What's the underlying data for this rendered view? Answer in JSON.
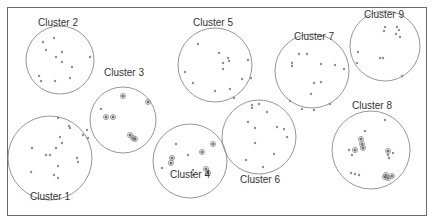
{
  "diagram": {
    "type": "cluster-map",
    "frame": {
      "x": 7,
      "y": 7,
      "w": 420,
      "h": 209
    },
    "colors": {
      "circle_stroke": "#8a8a8a",
      "point": "#8e8e8e",
      "frame": "#6a6a6a",
      "text": "#333333"
    },
    "clusters": [
      {
        "id": 1,
        "label": "Cluster 1",
        "cx": 50,
        "cy": 158,
        "r": 42,
        "label_x": 50,
        "label_y": 192,
        "points": [
          [
            58,
            118
          ],
          [
            69,
            126
          ],
          [
            70,
            128
          ],
          [
            87,
            130
          ],
          [
            83,
            135
          ],
          [
            88,
            138
          ],
          [
            60,
            137
          ],
          [
            62,
            143
          ],
          [
            32,
            148
          ],
          [
            56,
            148
          ],
          [
            46,
            155
          ],
          [
            50,
            155
          ],
          [
            77,
            158
          ],
          [
            78,
            162
          ],
          [
            31,
            172
          ],
          [
            58,
            166
          ],
          [
            54,
            175
          ],
          [
            58,
            178
          ]
        ],
        "rings": []
      },
      {
        "id": 2,
        "label": "Cluster 2",
        "cx": 60,
        "cy": 60,
        "r": 34,
        "label_x": 58,
        "label_y": 18,
        "points": [
          [
            43,
            42
          ],
          [
            54,
            38
          ],
          [
            46,
            50
          ],
          [
            62,
            52
          ],
          [
            56,
            57
          ],
          [
            62,
            62
          ],
          [
            90,
            57
          ],
          [
            72,
            67
          ],
          [
            39,
            76
          ],
          [
            41,
            81
          ],
          [
            55,
            81
          ],
          [
            70,
            78
          ]
        ],
        "rings": []
      },
      {
        "id": 3,
        "label": "Cluster 3",
        "cx": 123,
        "cy": 120,
        "r": 33,
        "label_x": 124,
        "label_y": 68,
        "points": [
          [
            101,
            109
          ]
        ],
        "rings": [
          [
            123,
            96
          ],
          [
            148,
            102
          ],
          [
            106,
            117
          ],
          [
            113,
            117
          ],
          [
            130,
            135
          ],
          [
            133,
            138
          ],
          [
            135,
            139
          ]
        ]
      },
      {
        "id": 4,
        "label": "Cluster 4",
        "cx": 190,
        "cy": 161,
        "r": 37,
        "label_x": 190,
        "label_y": 170,
        "points": [
          [
            176,
            144
          ],
          [
            188,
            155
          ],
          [
            162,
            168
          ],
          [
            193,
            170
          ],
          [
            193,
            175
          ]
        ],
        "rings": [
          [
            213,
            144
          ],
          [
            172,
            158
          ],
          [
            171,
            163
          ],
          [
            202,
            152
          ],
          [
            206,
            169
          ],
          [
            208,
            173
          ]
        ]
      },
      {
        "id": 5,
        "label": "Cluster 5",
        "cx": 215,
        "cy": 65,
        "r": 37,
        "label_x": 213,
        "label_y": 18,
        "points": [
          [
            198,
            44
          ],
          [
            219,
            53
          ],
          [
            228,
            58
          ],
          [
            229,
            61
          ],
          [
            223,
            63
          ],
          [
            223,
            69
          ],
          [
            248,
            60
          ],
          [
            185,
            72
          ],
          [
            193,
            83
          ],
          [
            242,
            79
          ],
          [
            251,
            78
          ],
          [
            230,
            89
          ],
          [
            215,
            91
          ],
          [
            234,
            98
          ]
        ],
        "rings": []
      },
      {
        "id": 6,
        "label": "Cluster 6",
        "cx": 259,
        "cy": 137,
        "r": 37,
        "label_x": 260,
        "label_y": 175,
        "points": [
          [
            252,
            105
          ],
          [
            252,
            108
          ],
          [
            259,
            104
          ],
          [
            267,
            112
          ],
          [
            248,
            122
          ],
          [
            255,
            128
          ],
          [
            277,
            127
          ],
          [
            284,
            129
          ],
          [
            287,
            137
          ],
          [
            255,
            143
          ],
          [
            274,
            154
          ],
          [
            246,
            160
          ],
          [
            263,
            167
          ]
        ],
        "rings": []
      },
      {
        "id": 7,
        "label": "Cluster 7",
        "cx": 312,
        "cy": 71,
        "r": 37,
        "label_x": 314,
        "label_y": 32,
        "points": [
          [
            299,
            54
          ],
          [
            307,
            54
          ],
          [
            292,
            63
          ],
          [
            292,
            66
          ],
          [
            321,
            64
          ],
          [
            335,
            65
          ],
          [
            344,
            69
          ],
          [
            314,
            83
          ],
          [
            321,
            82
          ],
          [
            311,
            94
          ],
          [
            290,
            101
          ],
          [
            302,
            109
          ],
          [
            314,
            110
          ],
          [
            330,
            104
          ]
        ],
        "rings": []
      },
      {
        "id": 8,
        "label": "Cluster 8",
        "cx": 371,
        "cy": 150,
        "r": 39,
        "label_x": 372,
        "label_y": 101,
        "points": [
          [
            385,
            120
          ],
          [
            365,
            131
          ],
          [
            349,
            150
          ],
          [
            352,
            155
          ],
          [
            388,
            155
          ],
          [
            393,
            153
          ],
          [
            389,
            158
          ],
          [
            351,
            173
          ],
          [
            355,
            174
          ],
          [
            359,
            175
          ]
        ],
        "rings": [
          [
            361,
            139
          ],
          [
            362,
            144
          ],
          [
            363,
            148
          ],
          [
            355,
            150
          ],
          [
            388,
            151
          ],
          [
            386,
            175
          ],
          [
            392,
            176
          ],
          [
            388,
            178
          ],
          [
            385,
            177
          ]
        ]
      },
      {
        "id": 9,
        "label": "Cluster 9",
        "cx": 385,
        "cy": 46,
        "r": 35,
        "label_x": 384,
        "label_y": 10,
        "points": [
          [
            385,
            27
          ],
          [
            384,
            31
          ],
          [
            397,
            27
          ],
          [
            399,
            30
          ],
          [
            396,
            34
          ],
          [
            400,
            37
          ],
          [
            358,
            52
          ],
          [
            357,
            63
          ],
          [
            380,
            58
          ],
          [
            383,
            58
          ],
          [
            402,
            76
          ]
        ],
        "rings": []
      }
    ]
  }
}
